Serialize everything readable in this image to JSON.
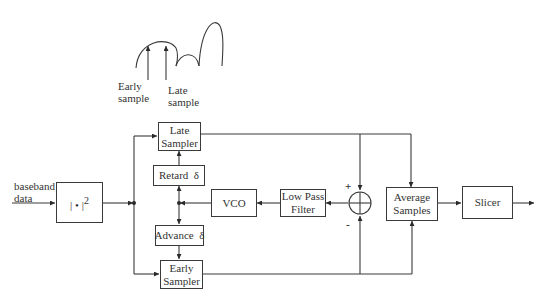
{
  "waveform_inset": {
    "early_label": [
      "Early",
      "sample"
    ],
    "late_label": [
      "Late",
      "sample"
    ]
  },
  "input": {
    "label": [
      "baseband",
      "data"
    ]
  },
  "blocks": {
    "magnitude_squared": {
      "label": "| • |",
      "superscript": "2"
    },
    "late_sampler": {
      "line1": "Late",
      "line2": "Sampler"
    },
    "retard": {
      "label": "Retard  δ"
    },
    "advance": {
      "label": "Advance  δ"
    },
    "early_sampler": {
      "line1": "Early",
      "line2": "Sampler"
    },
    "vco": {
      "label": "VCO"
    },
    "low_pass_filter": {
      "line1": "Low Pass",
      "line2": "Filter"
    },
    "summer": {
      "plus": "+",
      "minus": "-"
    },
    "average_samples": {
      "line1": "Average",
      "line2": "Samples"
    },
    "slicer": {
      "label": "Slicer"
    }
  },
  "colors": {
    "line": "#3a3a3a",
    "background": "#ffffff",
    "text": "#333333"
  }
}
